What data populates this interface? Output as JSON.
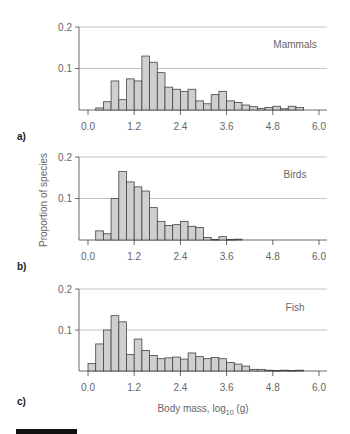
{
  "figure": {
    "y_axis_title": "Proportion of species",
    "x_axis_title_main": "Body mass, log",
    "x_axis_title_sub": "10",
    "x_axis_title_tail": " (g)"
  },
  "chart_data": [
    {
      "type": "bar",
      "panel": "a)",
      "title": "Mammals",
      "xlabel": "",
      "ylabel": "",
      "x_ticks": [
        "0.0",
        "1.2",
        "2.4",
        "3.6",
        "4.8",
        "6.0"
      ],
      "y_ticks": [
        "0.1",
        "0.2"
      ],
      "ylim": [
        0,
        0.2
      ],
      "xlim": [
        0,
        6.0
      ],
      "grid": true,
      "bin_width": 0.2,
      "bin_start": 0.2,
      "values": [
        0.005,
        0.02,
        0.07,
        0.025,
        0.075,
        0.07,
        0.13,
        0.115,
        0.09,
        0.055,
        0.05,
        0.045,
        0.05,
        0.022,
        0.015,
        0.037,
        0.045,
        0.022,
        0.018,
        0.012,
        0.008,
        0.004,
        0.006,
        0.009,
        0.003,
        0.009,
        0.006
      ]
    },
    {
      "type": "bar",
      "panel": "b)",
      "title": "Birds",
      "xlabel": "",
      "ylabel": "Proportion of species",
      "x_ticks": [
        "0.0",
        "1.2",
        "2.4",
        "3.6",
        "4.8",
        "6.0"
      ],
      "y_ticks": [
        "0.1",
        "0.2"
      ],
      "ylim": [
        0,
        0.2
      ],
      "xlim": [
        0,
        6.0
      ],
      "grid": true,
      "bin_width": 0.2,
      "bin_start": 0.2,
      "values": [
        0.022,
        0.015,
        0.1,
        0.165,
        0.14,
        0.128,
        0.118,
        0.078,
        0.045,
        0.035,
        0.037,
        0.045,
        0.033,
        0.03,
        0.006,
        0.001,
        0.008,
        0.001,
        0.002
      ]
    },
    {
      "type": "bar",
      "panel": "c)",
      "title": "Fish",
      "xlabel": "Body mass, log10 (g)",
      "ylabel": "",
      "x_ticks": [
        "0.0",
        "1.2",
        "2.4",
        "3.6",
        "4.8",
        "6.0"
      ],
      "y_ticks": [
        "0.1",
        "0.2"
      ],
      "ylim": [
        0,
        0.2
      ],
      "xlim": [
        0,
        6.0
      ],
      "grid": true,
      "bin_width": 0.2,
      "bin_start": 0.0,
      "values": [
        0.018,
        0.066,
        0.1,
        0.135,
        0.12,
        0.04,
        0.078,
        0.05,
        0.038,
        0.03,
        0.032,
        0.034,
        0.029,
        0.044,
        0.035,
        0.03,
        0.033,
        0.03,
        0.021,
        0.017,
        0.012,
        0.004,
        0.004,
        0.002,
        0.001,
        0.002,
        0.001,
        0.002
      ]
    }
  ]
}
